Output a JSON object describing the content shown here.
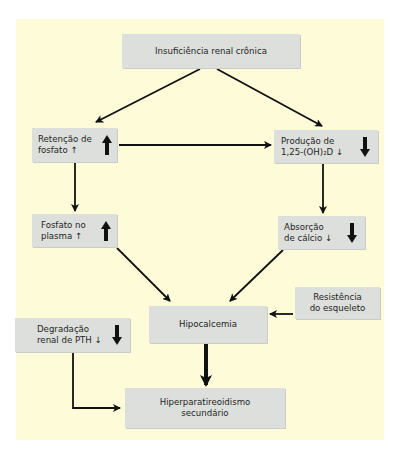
{
  "diagram": {
    "title_node": {
      "label": "Insuficiência renal crônica"
    },
    "nodes": {
      "retencao": {
        "line1": "Retenção de",
        "line2": "fosfato ↑",
        "indicator": "up"
      },
      "producao": {
        "line1": "Produção de",
        "line2": "1,25-(OH)₂D ↓",
        "indicator": "down"
      },
      "fosfato_plasma": {
        "line1": "Fosfato no",
        "line2": "plasma ↑",
        "indicator": "up"
      },
      "absorcao": {
        "line1": "Absorção",
        "line2": "de cálcio ↓",
        "indicator": "down"
      },
      "resistencia": {
        "line1": "Resistência",
        "line2": "do esqueleto"
      },
      "hipocalcemia": {
        "label": "Hipocalcemia"
      },
      "degradacao": {
        "line1": "Degradação",
        "line2": "renal de PTH ↓",
        "indicator": "down"
      },
      "hiperpara": {
        "line1": "Hiperparatireoidismo",
        "line2": "secundário"
      }
    },
    "edges": [
      {
        "from": "Insuficiência renal crônica",
        "to": "Retenção de fosfato"
      },
      {
        "from": "Insuficiência renal crônica",
        "to": "Produção de 1,25-(OH)₂D"
      },
      {
        "from": "Retenção de fosfato",
        "to": "Produção de 1,25-(OH)₂D"
      },
      {
        "from": "Retenção de fosfato",
        "to": "Fosfato no plasma"
      },
      {
        "from": "Produção de 1,25-(OH)₂D",
        "to": "Absorção de cálcio"
      },
      {
        "from": "Fosfato no plasma",
        "to": "Hipocalcemia"
      },
      {
        "from": "Absorção de cálcio",
        "to": "Hipocalcemia"
      },
      {
        "from": "Resistência do esqueleto",
        "to": "Hipocalcemia"
      },
      {
        "from": "Hipocalcemia",
        "to": "Hiperparatireoidismo secundário"
      },
      {
        "from": "Degradação renal de PTH",
        "to": "Hiperparatireoidismo secundário"
      }
    ],
    "colors": {
      "background": "#fdfbd8",
      "box": "#dcdfdb",
      "arrow": "#111111"
    }
  }
}
